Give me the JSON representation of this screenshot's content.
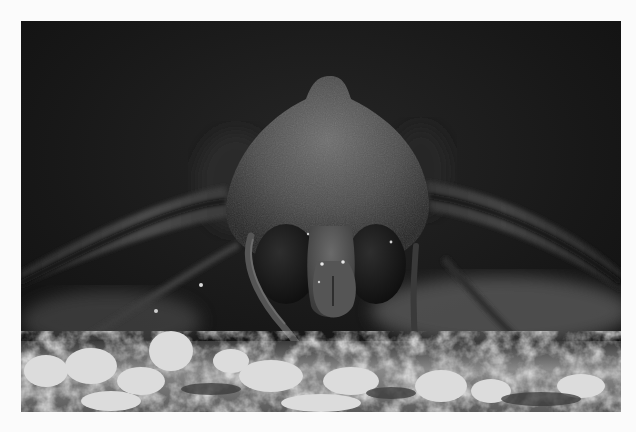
{
  "image": {
    "subject": "moth",
    "description": "Grayscale macro photograph of a moth viewed head-on, resting on a pale lichen-covered surface against a dark background",
    "color_mode": "grayscale",
    "colors": {
      "page_background": "#fbfbfb",
      "photo_background": "#161616",
      "body_tone": "#4a4a4a",
      "eye_tone": "#1c1c1c",
      "foreground_light": "#d6d6d6"
    }
  }
}
